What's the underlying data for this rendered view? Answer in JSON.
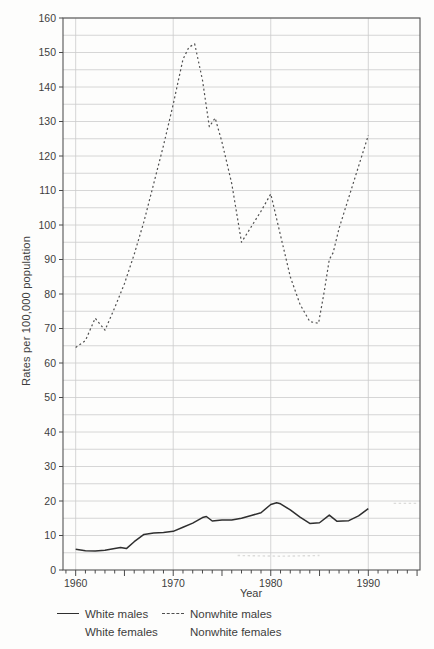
{
  "figure": {
    "background": "#fdfdfc",
    "grid_color": "#cbcbcb",
    "axis_color": "#555555",
    "tick_color": "#4a4a4a",
    "text_color": "#3d3d3d",
    "solid_line_color": "#2f2f2f",
    "dashed_line_color": "#4f4f4f",
    "artifact_color": "#dcdcda"
  },
  "chart_data": {
    "type": "line",
    "title": "",
    "xlabel": "Year",
    "ylabel": "Rates per 100,000 population",
    "xlim": [
      1958.7,
      1995.3
    ],
    "ylim": [
      0,
      160
    ],
    "x_ticks": [
      1960,
      1970,
      1980,
      1990
    ],
    "x_minor_tick_start": 1959,
    "x_minor_tick_end": 1995,
    "x_minor_tick_step": 1,
    "y_ticks": [
      0,
      10,
      20,
      30,
      40,
      50,
      60,
      70,
      80,
      90,
      100,
      110,
      120,
      130,
      140,
      150,
      160
    ],
    "y_grid_step": 5,
    "x_grid_years": [
      1960,
      1970,
      1980,
      1990
    ],
    "grid": "on, light gray; horizontal every 5 units, vertical at decades; full box border",
    "legend_position": "below chart, two rows",
    "series": [
      {
        "name": "White males",
        "style": "solid",
        "points": [
          [
            1960,
            6
          ],
          [
            1961,
            5.6
          ],
          [
            1962,
            5.5
          ],
          [
            1963,
            5.7
          ],
          [
            1964,
            6.2
          ],
          [
            1964.6,
            6.5
          ],
          [
            1965.2,
            6.2
          ],
          [
            1966,
            8.2
          ],
          [
            1967,
            10.3
          ],
          [
            1968,
            10.7
          ],
          [
            1969,
            10.9
          ],
          [
            1970,
            11.2
          ],
          [
            1971,
            12.4
          ],
          [
            1972,
            13.6
          ],
          [
            1973,
            15.2
          ],
          [
            1973.4,
            15.5
          ],
          [
            1974,
            14.2
          ],
          [
            1975,
            14.5
          ],
          [
            1976,
            14.5
          ],
          [
            1977,
            15
          ],
          [
            1978,
            15.8
          ],
          [
            1979,
            16.6
          ],
          [
            1980,
            19
          ],
          [
            1980.6,
            19.5
          ],
          [
            1981,
            19.2
          ],
          [
            1982,
            17.4
          ],
          [
            1983,
            15.3
          ],
          [
            1984,
            13.5
          ],
          [
            1985,
            13.7
          ],
          [
            1986,
            15.9
          ],
          [
            1986.8,
            14.1
          ],
          [
            1988,
            14.3
          ],
          [
            1989,
            15.7
          ],
          [
            1990,
            17.8
          ]
        ]
      },
      {
        "name": "Nonwhite males",
        "style": "dashed",
        "points": [
          [
            1960,
            64.5
          ],
          [
            1961,
            66.5
          ],
          [
            1962,
            73
          ],
          [
            1963,
            69.5
          ],
          [
            1964,
            76
          ],
          [
            1965,
            83
          ],
          [
            1966,
            91.5
          ],
          [
            1967,
            101
          ],
          [
            1968,
            112
          ],
          [
            1969,
            123
          ],
          [
            1970,
            135
          ],
          [
            1971,
            148
          ],
          [
            1971.6,
            151.5
          ],
          [
            1972.2,
            152.5
          ],
          [
            1973,
            142
          ],
          [
            1973.7,
            128.5
          ],
          [
            1974.3,
            131
          ],
          [
            1975,
            124
          ],
          [
            1976,
            112
          ],
          [
            1977,
            95
          ],
          [
            1978,
            99.5
          ],
          [
            1979,
            104
          ],
          [
            1980,
            109
          ],
          [
            1981,
            97
          ],
          [
            1982,
            85
          ],
          [
            1983,
            77
          ],
          [
            1984,
            72
          ],
          [
            1984.9,
            71.5
          ],
          [
            1985.5,
            81
          ],
          [
            1986,
            90
          ],
          [
            1986.4,
            92
          ],
          [
            1987,
            99
          ],
          [
            1988,
            108
          ],
          [
            1989,
            117
          ],
          [
            1990,
            126
          ]
        ]
      },
      {
        "name": "White females",
        "style": "not-visible-in-plot",
        "points": []
      },
      {
        "name": "Nonwhite females",
        "style": "not-visible-in-plot",
        "points": []
      }
    ],
    "scan_artifacts": [
      {
        "name": "faint dashed remnant near bottom",
        "points": [
          [
            1976.6,
            4.2
          ],
          [
            1981,
            4.0
          ],
          [
            1985,
            4.2
          ]
        ]
      },
      {
        "name": "faint dashed remnant top right",
        "points": [
          [
            1992.6,
            19.3
          ],
          [
            1995.0,
            19.3
          ]
        ]
      }
    ]
  },
  "legend": {
    "rows": [
      [
        {
          "label": "White males",
          "swatch": "solid"
        },
        {
          "label": "Nonwhite males",
          "swatch": "dashed"
        }
      ],
      [
        {
          "label": "White females",
          "swatch": "none"
        },
        {
          "label": "Nonwhite females",
          "swatch": "none"
        }
      ]
    ]
  }
}
